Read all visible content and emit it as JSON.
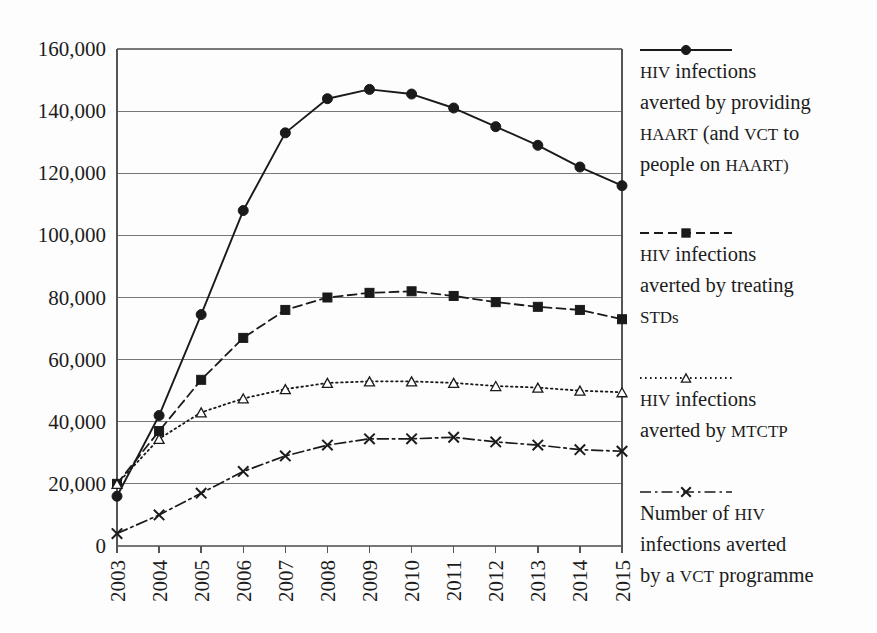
{
  "chart_data": {
    "type": "line",
    "title": "",
    "xlabel": "",
    "ylabel": "",
    "grid": true,
    "legend_position": "right",
    "categories": [
      "2003",
      "2004",
      "2005",
      "2006",
      "2007",
      "2008",
      "2009",
      "2010",
      "2011",
      "2012",
      "2013",
      "2014",
      "2015"
    ],
    "x": [
      2003,
      2004,
      2005,
      2006,
      2007,
      2008,
      2009,
      2010,
      2011,
      2012,
      2013,
      2014,
      2015
    ],
    "xlim": [
      2003,
      2015
    ],
    "ylim": [
      0,
      160000
    ],
    "yticks": [
      0,
      20000,
      40000,
      60000,
      80000,
      100000,
      120000,
      140000,
      160000
    ],
    "ytick_labels": [
      "0",
      "20,000",
      "40,000",
      "60,000",
      "80,000",
      "100,000",
      "120,000",
      "140,000",
      "160,000"
    ],
    "series": [
      {
        "name": "HIV infections averted by providing HAART (and VCT to people on HAART)",
        "marker": "filled-circle",
        "linestyle": "solid",
        "color": "#1a1a1a",
        "values": [
          16000,
          42000,
          74500,
          108000,
          133000,
          144000,
          147000,
          145500,
          141000,
          135000,
          129000,
          122000,
          116000
        ]
      },
      {
        "name": "HIV infections averted by treating STDs",
        "marker": "filled-square",
        "linestyle": "dashed",
        "color": "#1a1a1a",
        "values": [
          20000,
          37000,
          53500,
          67000,
          76000,
          80000,
          81500,
          82000,
          80500,
          78500,
          77000,
          76000,
          73000
        ]
      },
      {
        "name": "HIV infections averted by MTCTP",
        "marker": "open-triangle",
        "linestyle": "dotted",
        "color": "#1a1a1a",
        "values": [
          20000,
          34500,
          43000,
          47500,
          50500,
          52500,
          53000,
          53000,
          52500,
          51500,
          51000,
          50000,
          49500
        ]
      },
      {
        "name": "Number of HIV infections averted by a VCT programme",
        "marker": "cross",
        "linestyle": "dashdot",
        "color": "#1a1a1a",
        "values": [
          4000,
          10000,
          17000,
          24000,
          29000,
          32500,
          34500,
          34500,
          35000,
          33500,
          32500,
          31000,
          30500
        ]
      }
    ]
  },
  "legend": {
    "entries": [
      {
        "key": "legend-haart",
        "marker": "filled-circle",
        "linestyle": "solid",
        "lines": [
          "HIV infections",
          "averted by providing",
          "HAART (and VCT to",
          "people on HAART)"
        ]
      },
      {
        "key": "legend-stds",
        "marker": "filled-square",
        "linestyle": "dashed",
        "lines": [
          "HIV infections",
          "averted by treating",
          "STDs"
        ]
      },
      {
        "key": "legend-mtctp",
        "marker": "open-triangle",
        "linestyle": "dotted",
        "lines": [
          "HIV infections",
          "averted by MTCTP"
        ]
      },
      {
        "key": "legend-vct",
        "marker": "cross",
        "linestyle": "dashdot",
        "lines": [
          "Number of HIV",
          "infections averted",
          "by a VCT programme"
        ]
      }
    ]
  },
  "geometry": {
    "plot_left": 117,
    "plot_right": 622,
    "plot_top": 49,
    "plot_bottom": 546,
    "legend_x": 640,
    "legend_sample_width": 92,
    "legend_blocks_y": [
      50,
      233,
      378,
      492
    ],
    "legend_line_height": 31,
    "legend_text_offset": 28
  }
}
